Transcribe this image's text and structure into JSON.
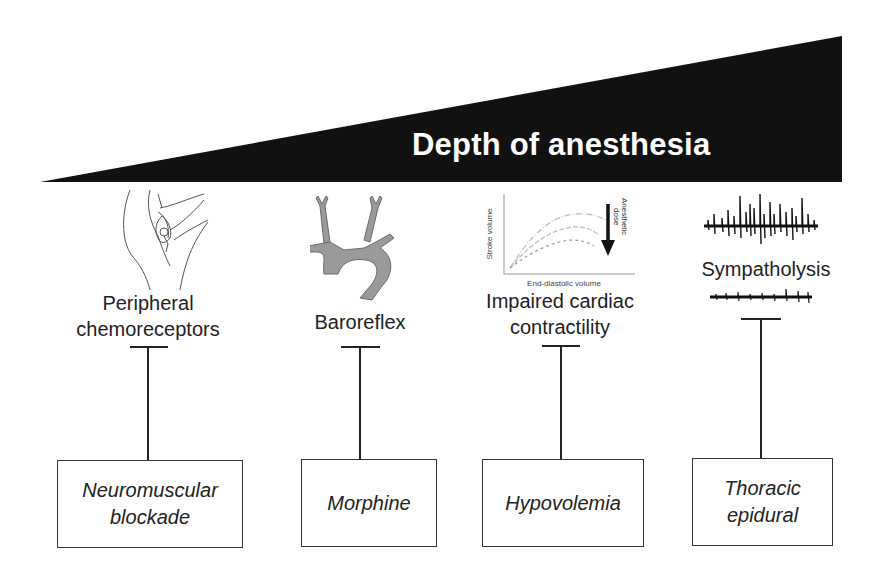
{
  "header": {
    "title": "Depth of anesthesia",
    "wedge_color": "#111111"
  },
  "columns": [
    {
      "icon": "carotid-body-sketch-icon",
      "label_line1": "Peripheral",
      "label_line2": "chemoreceptors",
      "inhibitor": "Neuromuscular\nblockade"
    },
    {
      "icon": "aortic-arch-icon",
      "label_line1": "Baroreflex",
      "inhibitor": "Morphine"
    },
    {
      "icon": "frank-starling-curve-icon",
      "label_line1": "Impaired cardiac",
      "label_line2": "contractility",
      "inhibitor": "Hypovolemia",
      "mini_chart": {
        "ylabel": "Stroke volume",
        "xlabel": "End-diastolic volume",
        "arrow_label_line1": "Anesthetic",
        "arrow_label_line2": "dose"
      }
    },
    {
      "icon": "sympathetic-nerve-trace-icon",
      "label_line1": "Sympatholysis",
      "inhibitor": "Thoracic\nepidural"
    }
  ]
}
